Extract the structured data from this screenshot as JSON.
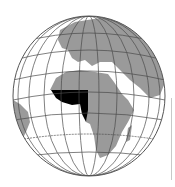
{
  "map": {
    "type": "orthographic-globe",
    "view_center": "Africa / Europe",
    "highlighted_region": "West Africa",
    "colors": {
      "ocean": "#ffffff",
      "land": "#9a9a9a",
      "highlight": "#000000",
      "graticule": "#4a4a4a",
      "outline": "#555555"
    }
  }
}
